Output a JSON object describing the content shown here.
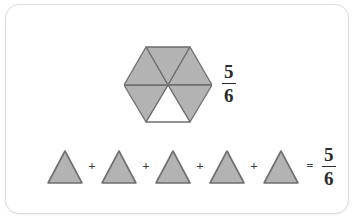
{
  "page": {
    "background_color": "#ffffff",
    "card": {
      "background_color": "#ffffff",
      "border_color": "#dcdcdc"
    }
  },
  "colors": {
    "shape_fill": "#b3b3b3",
    "shape_empty_fill": "#ffffff",
    "shape_stroke": "#6e6e6e",
    "text": "#2b2b2b"
  },
  "hexagon_model": {
    "label": "hexagon-divided-into-sixths",
    "total_parts": 6,
    "shaded_parts": 5,
    "unshaded_parts": 1,
    "parts": [
      {
        "index": 1,
        "position": "top-left",
        "shaded": true
      },
      {
        "index": 2,
        "position": "top-right",
        "shaded": true
      },
      {
        "index": 3,
        "position": "right",
        "shaded": true
      },
      {
        "index": 4,
        "position": "bottom-right",
        "shaded": true
      },
      {
        "index": 5,
        "position": "bottom-center",
        "shaded": false
      },
      {
        "index": 6,
        "position": "left",
        "shaded": true
      }
    ]
  },
  "hexagon_fraction": {
    "numerator": "5",
    "denominator": "6"
  },
  "equation": {
    "terms": [
      {
        "shape": "triangle",
        "shaded": true
      },
      {
        "shape": "triangle",
        "shaded": true
      },
      {
        "shape": "triangle",
        "shaded": true
      },
      {
        "shape": "triangle",
        "shaded": true
      },
      {
        "shape": "triangle",
        "shaded": true
      }
    ],
    "plus_operators": [
      "+",
      "+",
      "+",
      "+"
    ],
    "equals_operator": "=",
    "result": {
      "numerator": "5",
      "denominator": "6"
    }
  }
}
